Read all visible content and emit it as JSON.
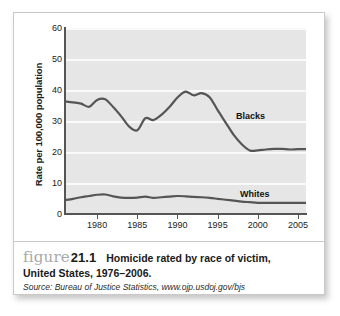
{
  "figure": {
    "word": "figure",
    "number": "21.1",
    "title_line_1": "Homicide rated by race of victim,",
    "title_line_2": "United States, 1976–2006.",
    "source": "Source: Bureau of Justice Statistics, www.ojp.usdoj.gov/bjs"
  },
  "chart_data": {
    "type": "line",
    "title": "",
    "xlabel": "",
    "ylabel": "Rate per 100,000 population",
    "xlim": [
      1976,
      2006
    ],
    "ylim": [
      0,
      60
    ],
    "yticks": [
      0,
      10,
      20,
      30,
      40,
      50,
      60
    ],
    "xticks": [
      1980,
      1985,
      1990,
      1995,
      2000,
      2005
    ],
    "xticklabels": [
      "1980",
      "1985",
      "1990",
      "1995",
      "2000",
      "2005"
    ],
    "yticklabels": [
      "0",
      "10",
      "20",
      "30",
      "40",
      "50",
      "60"
    ],
    "grid": "horizontal",
    "legend": "inline-labels",
    "plot_background": "#e6e6e6",
    "gridline_color": "#fafafa",
    "line_color": "#555555",
    "x": [
      1976,
      1977,
      1978,
      1979,
      1980,
      1981,
      1982,
      1983,
      1984,
      1985,
      1986,
      1987,
      1988,
      1989,
      1990,
      1991,
      1992,
      1993,
      1994,
      1995,
      1996,
      1997,
      1998,
      1999,
      2000,
      2001,
      2002,
      2003,
      2004,
      2005,
      2006
    ],
    "series": [
      {
        "name": "Blacks",
        "label": "Blacks",
        "color": "#555555",
        "values": [
          36.3,
          36.0,
          35.6,
          34.6,
          36.8,
          37.0,
          34.5,
          31.5,
          28.2,
          27.0,
          30.9,
          30.3,
          32.0,
          34.5,
          37.6,
          39.5,
          38.3,
          39.0,
          37.7,
          33.5,
          29.5,
          25.5,
          22.5,
          20.5,
          20.5,
          20.8,
          21.0,
          21.0,
          20.8,
          20.9,
          20.9
        ]
      },
      {
        "name": "Whites",
        "label": "Whites",
        "color": "#555555",
        "values": [
          4.5,
          4.9,
          5.4,
          5.8,
          6.2,
          6.3,
          5.7,
          5.3,
          5.2,
          5.3,
          5.6,
          5.2,
          5.4,
          5.6,
          5.8,
          5.7,
          5.5,
          5.4,
          5.2,
          4.9,
          4.6,
          4.3,
          4.0,
          3.8,
          3.6,
          3.6,
          3.6,
          3.6,
          3.6,
          3.6,
          3.6
        ]
      }
    ]
  }
}
